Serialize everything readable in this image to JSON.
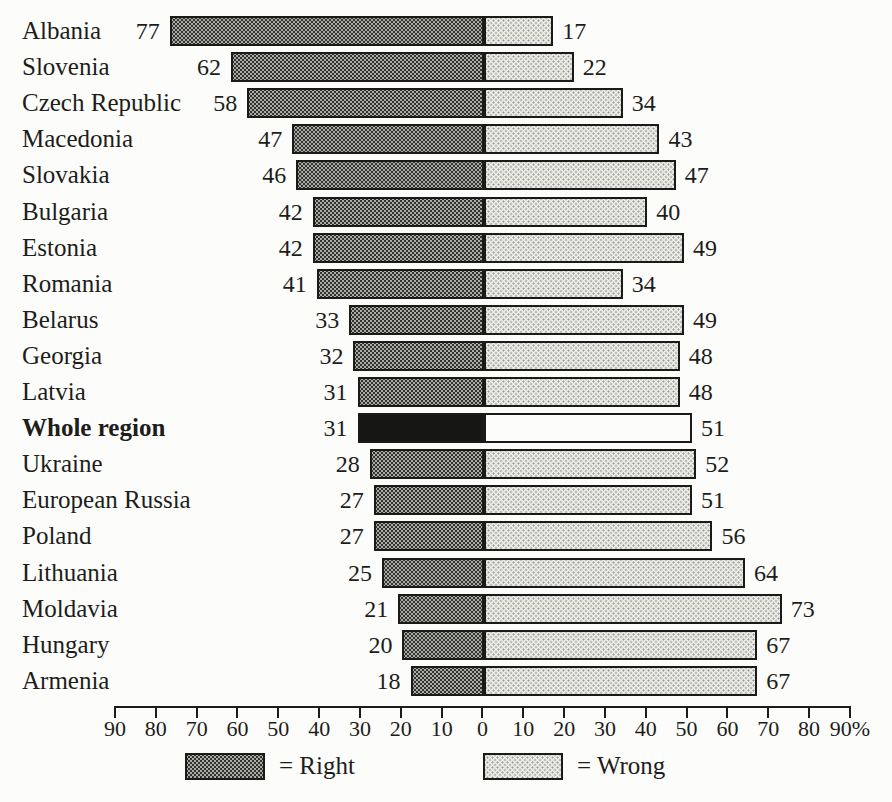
{
  "chart_data": {
    "type": "bar",
    "subtype": "diverging-horizontal",
    "title": "",
    "unit": "%",
    "categories": [
      "Albania",
      "Slovenia",
      "Czech Republic",
      "Macedonia",
      "Slovakia",
      "Bulgaria",
      "Estonia",
      "Romania",
      "Belarus",
      "Georgia",
      "Latvia",
      "Whole region",
      "Ukraine",
      "European Russia",
      "Poland",
      "Lithuania",
      "Moldavia",
      "Hungary",
      "Armenia"
    ],
    "series": [
      {
        "name": "Right",
        "side": "left",
        "values": [
          77,
          62,
          58,
          47,
          46,
          42,
          42,
          41,
          33,
          32,
          31,
          31,
          28,
          27,
          27,
          25,
          21,
          20,
          18
        ]
      },
      {
        "name": "Wrong",
        "side": "right",
        "values": [
          17,
          22,
          34,
          43,
          47,
          40,
          49,
          34,
          49,
          48,
          48,
          51,
          52,
          51,
          56,
          64,
          73,
          67,
          67
        ]
      }
    ],
    "emphasis_category": "Whole region",
    "axis": {
      "max": 90,
      "tick_step": 10,
      "ticks": [
        "90",
        "80",
        "70",
        "60",
        "50",
        "40",
        "30",
        "20",
        "10",
        "0",
        "10",
        "20",
        "30",
        "40",
        "50",
        "60",
        "70",
        "80",
        "90%"
      ]
    },
    "legend": [
      {
        "label": "= Right",
        "swatch": "dark-pattern"
      },
      {
        "label": "= Wrong",
        "swatch": "light-pattern"
      }
    ],
    "colors": {
      "background": "#fcfcfa",
      "text": "#1d1d1b",
      "bar_border": "#1a1a18",
      "dark_pattern_dot": "#32322f",
      "dark_pattern_base": "#ababa6",
      "light_pattern_dot": "#9e9e98",
      "light_pattern_base": "#efefeb",
      "emphasis_left_bar": "#161614",
      "emphasis_right_bar": "#fcfcfa"
    }
  }
}
